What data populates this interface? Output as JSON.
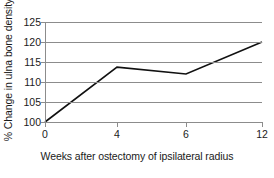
{
  "chart_data": {
    "type": "line",
    "title": "",
    "xlabel": "Weeks after ostectomy of ipsilateral radius",
    "ylabel": "% Change in ulna bone density",
    "x_categories": [
      "0",
      "4",
      "6",
      "12"
    ],
    "x": [
      0,
      4,
      6,
      12
    ],
    "x_scale": "categorical",
    "values": [
      100,
      113.7,
      112,
      120
    ],
    "series": [
      {
        "name": "% Change in ulna bone density",
        "values": [
          100,
          113.7,
          112,
          120
        ],
        "color": "#111111"
      }
    ],
    "ylim": [
      100,
      125
    ],
    "y_ticks": [
      100,
      105,
      110,
      115,
      120,
      125
    ],
    "y_tick_labels": [
      "100",
      "105",
      "110",
      "115",
      "120",
      "125"
    ],
    "x_tick_labels": [
      "0",
      "4",
      "6",
      "12"
    ],
    "grid": {
      "horizontal": true,
      "vertical": false,
      "color": "#8c8c8c"
    },
    "legend": {
      "visible": false,
      "position": "none"
    },
    "axis_color": "#8c8c8c",
    "background": "#ffffff"
  }
}
